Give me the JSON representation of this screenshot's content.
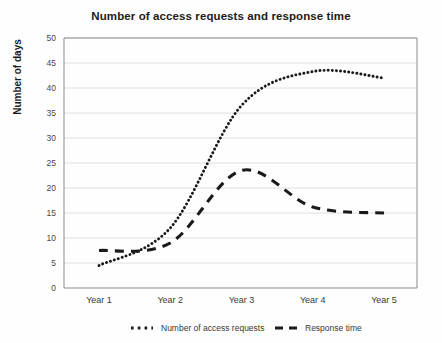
{
  "chart_data": {
    "type": "line",
    "title": "Number of access requests and response time",
    "xlabel": "",
    "ylabel": "Number of days",
    "categories": [
      "Year 1",
      "Year 2",
      "Year 3",
      "Year 4",
      "Year 5"
    ],
    "ylim": [
      0,
      50
    ],
    "ytick_step": 5,
    "yticks": [
      "0",
      "5",
      "10",
      "15",
      "20",
      "25",
      "30",
      "35",
      "40",
      "45",
      "50"
    ],
    "grid": true,
    "legend_position": "bottom",
    "series": [
      {
        "name": "Number of access requests",
        "style": "dotted",
        "color": "#1a1a1a",
        "values": [
          4.5,
          12.0,
          36.5,
          43.3,
          42.0
        ]
      },
      {
        "name": "Response time",
        "style": "dashed",
        "color": "#1a1a1a",
        "values": [
          7.5,
          9.0,
          23.5,
          16.2,
          15.0
        ]
      }
    ]
  },
  "legend": {
    "items": [
      {
        "label": "Number of access requests",
        "marker": "dotted-marker"
      },
      {
        "label": "Response time",
        "marker": "dashed-marker"
      }
    ]
  }
}
